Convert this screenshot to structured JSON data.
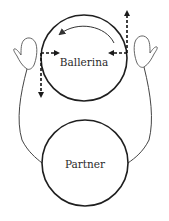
{
  "diagram": {
    "nodes": [
      {
        "id": "ballerina",
        "label": "Ballerina"
      },
      {
        "id": "partner",
        "label": "Partner"
      }
    ],
    "elements": {
      "rotation_arrow": "counterclockwise-arc-arrow",
      "left_hand": "hand-icon",
      "right_hand": "hand-icon",
      "left_forces": [
        "dashed-arrow-right",
        "dashed-arrow-down"
      ],
      "right_forces": [
        "dashed-arrow-left",
        "dashed-arrow-up"
      ]
    },
    "colors": {
      "stroke": "#2a2a2a",
      "hand_stroke": "#555555",
      "background": "#ffffff"
    }
  }
}
